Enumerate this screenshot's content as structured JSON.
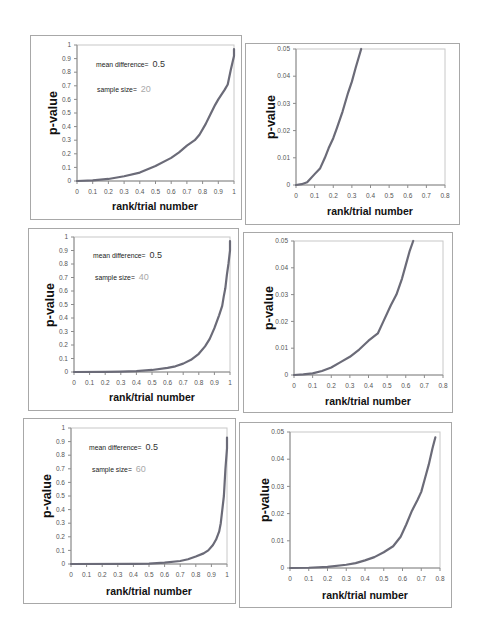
{
  "figure": {
    "panels": [
      {
        "annotation": {
          "mean_difference_label": "mean difference=",
          "mean_difference_value": "0.5",
          "sample_size_label": "sample size=",
          "sample_size_value": "20"
        }
      },
      {},
      {
        "annotation": {
          "mean_difference_label": "mean difference=",
          "mean_difference_value": "0.5",
          "sample_size_label": "sample size=",
          "sample_size_value": "40"
        }
      },
      {},
      {
        "annotation": {
          "mean_difference_label": "mean difference=",
          "mean_difference_value": "0.5",
          "sample_size_label": "sample size=",
          "sample_size_value": "60"
        }
      },
      {}
    ],
    "colors": {
      "curve": "#6b6b78",
      "axis": "#8c8c8c",
      "plot_border": "#c8c8c8",
      "tick_label": "#555555"
    }
  },
  "chart_data": [
    {
      "type": "line",
      "title": "",
      "xlabel": "rank/trial number",
      "ylabel": "p-value",
      "xlim": [
        0,
        1
      ],
      "ylim": [
        0,
        1
      ],
      "x_ticks": [
        "0",
        "0.1",
        "0.2",
        "0.3",
        "0.4",
        "0.5",
        "0.6",
        "0.7",
        "0.8",
        "0.9",
        "1"
      ],
      "y_ticks": [
        "0",
        "0.1",
        "0.2",
        "0.3",
        "0.4",
        "0.5",
        "0.6",
        "0.7",
        "0.8",
        "0.9",
        "1"
      ],
      "grid": false,
      "legend": null,
      "annotations": [
        "mean difference= 0.5",
        "sample size= 20"
      ],
      "series": [
        {
          "name": "sorted p-values (n=20)",
          "points": [
            [
              0,
              0
            ],
            [
              0.1,
              0.004
            ],
            [
              0.2,
              0.015
            ],
            [
              0.3,
              0.035
            ],
            [
              0.4,
              0.062
            ],
            [
              0.5,
              0.11
            ],
            [
              0.6,
              0.17
            ],
            [
              0.65,
              0.21
            ],
            [
              0.7,
              0.26
            ],
            [
              0.75,
              0.3
            ],
            [
              0.78,
              0.34
            ],
            [
              0.82,
              0.42
            ],
            [
              0.85,
              0.49
            ],
            [
              0.88,
              0.56
            ],
            [
              0.9,
              0.6
            ],
            [
              0.94,
              0.67
            ],
            [
              0.96,
              0.71
            ],
            [
              0.98,
              0.82
            ],
            [
              1.0,
              0.92
            ],
            [
              1.0,
              0.97
            ]
          ]
        }
      ]
    },
    {
      "type": "line",
      "title": "",
      "xlabel": "rank/trial number",
      "ylabel": "p-value",
      "xlim": [
        0,
        0.8
      ],
      "ylim": [
        0,
        0.05
      ],
      "x_ticks": [
        "0",
        "0.1",
        "0.2",
        "0.3",
        "0.4",
        "0.5",
        "0.6",
        "0.7",
        "0.8"
      ],
      "y_ticks": [
        "0",
        "0.01",
        "0.02",
        "0.03",
        "0.04",
        "0.05"
      ],
      "grid": false,
      "legend": null,
      "annotations": [],
      "series": [
        {
          "name": "sorted p-values (n=20, zoomed)",
          "points": [
            [
              0,
              0
            ],
            [
              0.03,
              0.0003
            ],
            [
              0.06,
              0.001
            ],
            [
              0.1,
              0.004
            ],
            [
              0.13,
              0.0062
            ],
            [
              0.155,
              0.01
            ],
            [
              0.175,
              0.0135
            ],
            [
              0.2,
              0.0172
            ],
            [
              0.22,
              0.021
            ],
            [
              0.25,
              0.027
            ],
            [
              0.28,
              0.034
            ],
            [
              0.3,
              0.038
            ],
            [
              0.32,
              0.043
            ],
            [
              0.35,
              0.05
            ]
          ]
        }
      ]
    },
    {
      "type": "line",
      "title": "",
      "xlabel": "rank/trial number",
      "ylabel": "p-value",
      "xlim": [
        0,
        1
      ],
      "ylim": [
        0,
        1
      ],
      "x_ticks": [
        "0",
        "0.1",
        "0.2",
        "0.3",
        "0.4",
        "0.5",
        "0.6",
        "0.7",
        "0.8",
        "0.9",
        "1"
      ],
      "y_ticks": [
        "0",
        "0.1",
        "0.2",
        "0.3",
        "0.4",
        "0.5",
        "0.6",
        "0.7",
        "0.8",
        "0.9",
        "1"
      ],
      "grid": false,
      "legend": null,
      "annotations": [
        "mean difference= 0.5",
        "sample size= 40"
      ],
      "series": [
        {
          "name": "sorted p-values (n=40)",
          "points": [
            [
              0,
              0
            ],
            [
              0.2,
              0.001
            ],
            [
              0.3,
              0.003
            ],
            [
              0.4,
              0.007
            ],
            [
              0.5,
              0.015
            ],
            [
              0.6,
              0.03
            ],
            [
              0.65,
              0.042
            ],
            [
              0.7,
              0.062
            ],
            [
              0.75,
              0.09
            ],
            [
              0.8,
              0.135
            ],
            [
              0.84,
              0.19
            ],
            [
              0.87,
              0.245
            ],
            [
              0.9,
              0.325
            ],
            [
              0.93,
              0.42
            ],
            [
              0.95,
              0.49
            ],
            [
              0.96,
              0.56
            ],
            [
              0.97,
              0.62
            ],
            [
              0.98,
              0.72
            ],
            [
              0.99,
              0.8
            ],
            [
              1.0,
              0.9
            ],
            [
              1.0,
              0.97
            ]
          ]
        }
      ]
    },
    {
      "type": "line",
      "title": "",
      "xlabel": "rank/trial number",
      "ylabel": "p-value",
      "xlim": [
        0,
        0.8
      ],
      "ylim": [
        0,
        0.05
      ],
      "x_ticks": [
        "0",
        "0.1",
        "0.2",
        "0.3",
        "0.4",
        "0.5",
        "0.6",
        "0.7",
        "0.8"
      ],
      "y_ticks": [
        "0",
        "0.01",
        "0.02",
        "0.03",
        "0.04",
        "0.05"
      ],
      "grid": false,
      "legend": null,
      "annotations": [],
      "series": [
        {
          "name": "sorted p-values (n=40, zoomed)",
          "points": [
            [
              0,
              0
            ],
            [
              0.05,
              0.0002
            ],
            [
              0.1,
              0.0006
            ],
            [
              0.15,
              0.0015
            ],
            [
              0.2,
              0.0028
            ],
            [
              0.25,
              0.0048
            ],
            [
              0.3,
              0.0068
            ],
            [
              0.35,
              0.0095
            ],
            [
              0.4,
              0.0128
            ],
            [
              0.45,
              0.0155
            ],
            [
              0.48,
              0.02
            ],
            [
              0.52,
              0.026
            ],
            [
              0.55,
              0.03
            ],
            [
              0.58,
              0.036
            ],
            [
              0.6,
              0.041
            ],
            [
              0.62,
              0.046
            ],
            [
              0.64,
              0.05
            ]
          ]
        }
      ]
    },
    {
      "type": "line",
      "title": "",
      "xlabel": "rank/trial number",
      "ylabel": "p-value",
      "xlim": [
        0,
        1
      ],
      "ylim": [
        0,
        1
      ],
      "x_ticks": [
        "0",
        "0.1",
        "0.2",
        "0.3",
        "0.4",
        "0.5",
        "0.6",
        "0.7",
        "0.8",
        "0.9",
        "1"
      ],
      "y_ticks": [
        "0",
        "0.1",
        "0.2",
        "0.3",
        "0.4",
        "0.5",
        "0.6",
        "0.7",
        "0.8",
        "0.9",
        "1"
      ],
      "grid": false,
      "legend": null,
      "annotations": [
        "mean difference= 0.5",
        "sample size= 60"
      ],
      "series": [
        {
          "name": "sorted p-values (n=60)",
          "points": [
            [
              0,
              0
            ],
            [
              0.4,
              0.001
            ],
            [
              0.5,
              0.003
            ],
            [
              0.6,
              0.01
            ],
            [
              0.7,
              0.022
            ],
            [
              0.75,
              0.035
            ],
            [
              0.8,
              0.055
            ],
            [
              0.85,
              0.078
            ],
            [
              0.88,
              0.1
            ],
            [
              0.91,
              0.14
            ],
            [
              0.93,
              0.18
            ],
            [
              0.95,
              0.24
            ],
            [
              0.96,
              0.3
            ],
            [
              0.97,
              0.4
            ],
            [
              0.98,
              0.5
            ],
            [
              0.985,
              0.6
            ],
            [
              0.99,
              0.7
            ],
            [
              1.0,
              0.85
            ],
            [
              1.0,
              0.93
            ]
          ]
        }
      ]
    },
    {
      "type": "line",
      "title": "",
      "xlabel": "rank/trial number",
      "ylabel": "p-value",
      "xlim": [
        0,
        0.8
      ],
      "ylim": [
        0,
        0.05
      ],
      "x_ticks": [
        "0",
        "0.1",
        "0.2",
        "0.3",
        "0.4",
        "0.5",
        "0.6",
        "0.7",
        "0.8"
      ],
      "y_ticks": [
        "0",
        "0.01",
        "0.02",
        "0.03",
        "0.04",
        "0.05"
      ],
      "grid": false,
      "legend": null,
      "annotations": [],
      "series": [
        {
          "name": "sorted p-values (n=60, zoomed)",
          "points": [
            [
              0,
              0
            ],
            [
              0.1,
              0.0001
            ],
            [
              0.2,
              0.0004
            ],
            [
              0.3,
              0.0012
            ],
            [
              0.35,
              0.0018
            ],
            [
              0.4,
              0.0028
            ],
            [
              0.45,
              0.004
            ],
            [
              0.5,
              0.0058
            ],
            [
              0.55,
              0.008
            ],
            [
              0.59,
              0.0115
            ],
            [
              0.62,
              0.016
            ],
            [
              0.65,
              0.021
            ],
            [
              0.68,
              0.025
            ],
            [
              0.7,
              0.028
            ],
            [
              0.72,
              0.033
            ],
            [
              0.74,
              0.038
            ],
            [
              0.76,
              0.044
            ],
            [
              0.775,
              0.048
            ]
          ]
        }
      ]
    }
  ]
}
